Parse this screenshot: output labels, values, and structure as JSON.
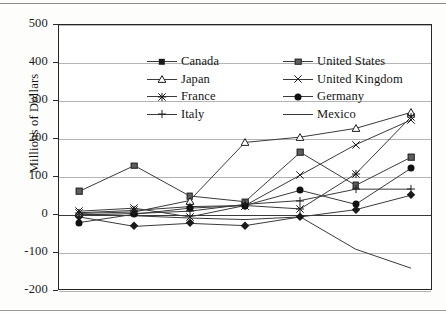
{
  "chart_data": {
    "type": "line",
    "title": "",
    "xlabel": "",
    "ylabel": "Millions of Dollars",
    "categories": [
      "1970",
      "1980",
      "1985",
      "1990",
      "1995",
      "2000",
      "2002"
    ],
    "ylim": [
      -200,
      500
    ],
    "ytick_labels": [
      "500",
      "400",
      "300",
      "200",
      "100",
      "0",
      "-100",
      "-200"
    ],
    "ytick_values": [
      500,
      400,
      300,
      200,
      100,
      0,
      -100,
      -200
    ],
    "grid": "horizontal",
    "legend_position": "top-left-inside",
    "series": [
      {
        "name": "Canada",
        "marker": "filled-diamond",
        "values": [
          -5,
          -30,
          -22,
          -28,
          -5,
          14,
          52
        ]
      },
      {
        "name": "United States",
        "marker": "filled-square",
        "values": [
          62,
          130,
          50,
          35,
          165,
          78,
          152
        ]
      },
      {
        "name": "Japan",
        "marker": "open-triangle",
        "values": [
          4,
          8,
          38,
          191,
          205,
          228,
          270
        ]
      },
      {
        "name": "United Kingdom",
        "marker": "cross-x",
        "values": [
          10,
          18,
          -5,
          25,
          105,
          185,
          250
        ]
      },
      {
        "name": "France",
        "marker": "asterisk",
        "values": [
          6,
          12,
          22,
          25,
          16,
          108,
          258
        ]
      },
      {
        "name": "Germany",
        "marker": "filled-circle",
        "values": [
          -20,
          2,
          18,
          25,
          65,
          28,
          123
        ]
      },
      {
        "name": "Italy",
        "marker": "plus",
        "values": [
          0,
          4,
          10,
          28,
          38,
          68,
          68
        ]
      },
      {
        "name": "Mexico",
        "marker": "none",
        "values": [
          2,
          -2,
          -8,
          -12,
          -5,
          -90,
          -140
        ]
      }
    ]
  },
  "legend": {
    "entries": [
      {
        "label": "Canada",
        "icon": "filled-diamond-marker-icon"
      },
      {
        "label": "United States",
        "icon": "filled-square-marker-icon"
      },
      {
        "label": "Japan",
        "icon": "open-triangle-marker-icon"
      },
      {
        "label": "United Kingdom",
        "icon": "cross-x-marker-icon"
      },
      {
        "label": "France",
        "icon": "asterisk-marker-icon"
      },
      {
        "label": "Germany",
        "icon": "filled-circle-marker-icon"
      },
      {
        "label": "Italy",
        "icon": "plus-marker-icon"
      },
      {
        "label": "Mexico",
        "icon": "plain-line-marker-icon"
      }
    ]
  },
  "colors": {
    "line": "#3a3a3a",
    "grid": "#b4b4b4",
    "axis": "#262626",
    "text": "#141414",
    "plot_background": "#ffffff",
    "page_background": "#fdfdfc"
  }
}
